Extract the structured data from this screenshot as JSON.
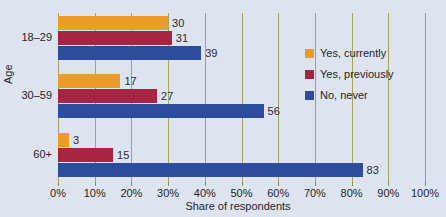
{
  "chart_data": {
    "type": "bar",
    "orientation": "horizontal",
    "title": "",
    "xlabel": "Share of respondents",
    "ylabel": "Age",
    "categories": [
      "18–29",
      "30–59",
      "60+"
    ],
    "series": [
      {
        "name": "Yes, currently",
        "color": "#ed9c28",
        "values": [
          30,
          17,
          3
        ]
      },
      {
        "name": "Yes, previously",
        "color": "#a52542",
        "values": [
          31,
          27,
          15
        ]
      },
      {
        "name": "No, never",
        "color": "#2e4c9e",
        "values": [
          39,
          56,
          83
        ]
      }
    ],
    "xlim": [
      0,
      100
    ],
    "xticks": [
      0,
      10,
      20,
      30,
      40,
      50,
      60,
      70,
      80,
      90,
      100
    ],
    "xtick_labels": [
      "0%",
      "10%",
      "20%",
      "30%",
      "40%",
      "50%",
      "60%",
      "70%",
      "80%",
      "90%",
      "100%"
    ],
    "data_labels": [
      [
        "30",
        "31",
        "39"
      ],
      [
        "17",
        "27",
        "56"
      ],
      [
        "3",
        "15",
        "83"
      ]
    ],
    "grid": true,
    "grid_axis": "x",
    "grid_color": "#a3a45f",
    "legend_position": "right",
    "background_color": "#dde4ef"
  }
}
